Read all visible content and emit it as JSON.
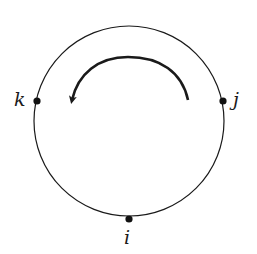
{
  "diagram": {
    "circle": {
      "cx": 129,
      "cy": 121,
      "r": 95,
      "stroke": "#1a1a1a"
    },
    "points": [
      {
        "id": "k",
        "label": "k",
        "x": 37,
        "y": 101
      },
      {
        "id": "j",
        "label": "j",
        "x": 223,
        "y": 101
      },
      {
        "id": "i",
        "label": "i",
        "x": 129,
        "y": 219
      }
    ],
    "arrow": {
      "direction": "counterclockwise",
      "from": "right",
      "to": "left",
      "color": "#1a1a1a"
    }
  }
}
